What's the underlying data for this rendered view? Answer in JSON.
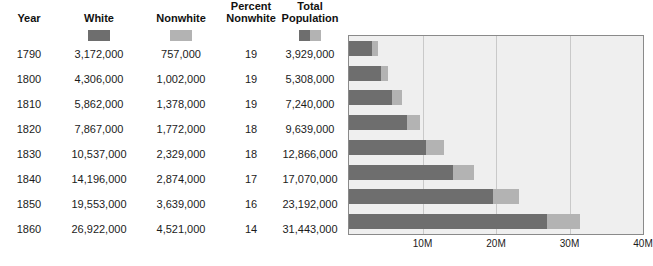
{
  "table": {
    "headers": [
      {
        "id": "year",
        "lines": [
          "Year"
        ]
      },
      {
        "id": "white",
        "lines": [
          "White"
        ]
      },
      {
        "id": "nonwhite",
        "lines": [
          "Nonwhite"
        ]
      },
      {
        "id": "percent_nonwhite",
        "lines": [
          "Percent",
          "Nonwhite"
        ]
      },
      {
        "id": "total_population",
        "lines": [
          "Total",
          "Population"
        ]
      }
    ],
    "swatches": [
      {
        "column": "white",
        "type": "solid",
        "color": "#6e6e6e"
      },
      {
        "column": "nonwhite",
        "type": "solid",
        "color": "#b3b3b3"
      },
      {
        "column": "total_population",
        "type": "split",
        "color_left": "#6e6e6e",
        "color_right": "#b3b3b3"
      }
    ],
    "rows": [
      {
        "year": "1790",
        "white": "3,172,000",
        "nonwhite": "757,000",
        "percent_nonwhite": "19",
        "total": "3,929,000"
      },
      {
        "year": "1800",
        "white": "4,306,000",
        "nonwhite": "1,002,000",
        "percent_nonwhite": "19",
        "total": "5,308,000"
      },
      {
        "year": "1810",
        "white": "5,862,000",
        "nonwhite": "1,378,000",
        "percent_nonwhite": "19",
        "total": "7,240,000"
      },
      {
        "year": "1820",
        "white": "7,867,000",
        "nonwhite": "1,772,000",
        "percent_nonwhite": "18",
        "total": "9,639,000"
      },
      {
        "year": "1830",
        "white": "10,537,000",
        "nonwhite": "2,329,000",
        "percent_nonwhite": "18",
        "total": "12,866,000"
      },
      {
        "year": "1840",
        "white": "14,196,000",
        "nonwhite": "2,874,000",
        "percent_nonwhite": "17",
        "total": "17,070,000"
      },
      {
        "year": "1850",
        "white": "19,553,000",
        "nonwhite": "3,639,000",
        "percent_nonwhite": "16",
        "total": "23,192,000"
      },
      {
        "year": "1860",
        "white": "26,922,000",
        "nonwhite": "4,521,000",
        "percent_nonwhite": "14",
        "total": "31,443,000"
      }
    ]
  },
  "chart_data": {
    "type": "bar",
    "orientation": "horizontal",
    "stacked": true,
    "title": "",
    "xlabel": "",
    "ylabel": "",
    "categories": [
      "1790",
      "1800",
      "1810",
      "1820",
      "1830",
      "1840",
      "1850",
      "1860"
    ],
    "series": [
      {
        "name": "White",
        "color": "#6e6e6e",
        "values": [
          3172000,
          4306000,
          5862000,
          7867000,
          10537000,
          14196000,
          19553000,
          26922000
        ]
      },
      {
        "name": "Nonwhite",
        "color": "#b3b3b3",
        "values": [
          757000,
          1002000,
          1378000,
          1772000,
          2329000,
          2874000,
          3639000,
          4521000
        ]
      }
    ],
    "totals": [
      3929000,
      5308000,
      7240000,
      9639000,
      12866000,
      17070000,
      23192000,
      31443000
    ],
    "xlim": [
      0,
      40000000
    ],
    "xticks": [
      10000000,
      20000000,
      30000000,
      40000000
    ],
    "xticklabels": [
      "10M",
      "20M",
      "30M",
      "40M"
    ],
    "grid": "vertical",
    "legend": "none",
    "plot_background": "#efefef",
    "border_color": "#8a8a8a",
    "gridline_color": "#c9c9c9"
  }
}
